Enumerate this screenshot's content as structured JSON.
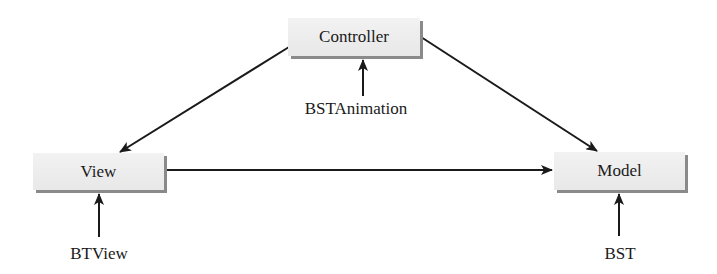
{
  "diagram": {
    "type": "mvc-architecture",
    "nodes": [
      {
        "id": "controller",
        "label": "Controller"
      },
      {
        "id": "view",
        "label": "View"
      },
      {
        "id": "model",
        "label": "Model"
      }
    ],
    "implementations": [
      {
        "target": "controller",
        "label": "BSTAnimation"
      },
      {
        "target": "view",
        "label": "BTView"
      },
      {
        "target": "model",
        "label": "BST"
      }
    ],
    "edges": [
      {
        "from": "controller",
        "to": "view"
      },
      {
        "from": "controller",
        "to": "model"
      },
      {
        "from": "view",
        "to": "model"
      },
      {
        "from": "BSTAnimation",
        "to": "controller"
      },
      {
        "from": "BTView",
        "to": "view"
      },
      {
        "from": "BST",
        "to": "model"
      }
    ],
    "colors": {
      "box_fill": "#ececec",
      "box_shadow": "#8a8a8a",
      "arrow": "#1a1a1a"
    }
  }
}
